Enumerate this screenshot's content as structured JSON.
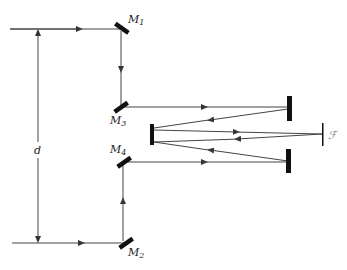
{
  "diagram": {
    "type": "optical-setup",
    "labels": {
      "distance": "d",
      "m1": "M",
      "m1_sub": "1",
      "m2": "M",
      "m2_sub": "2",
      "m3": "M",
      "m3_sub": "3",
      "m4": "M",
      "m4_sub": "4",
      "screen": "ℱ"
    },
    "colors": {
      "line": "#333333",
      "mirror": "#111111"
    }
  }
}
